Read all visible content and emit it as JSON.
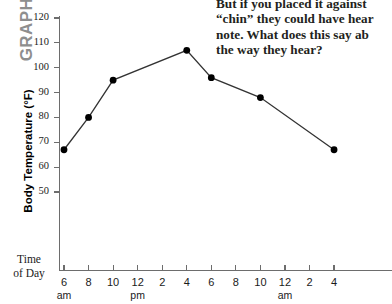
{
  "graph_label": "GRAPH A",
  "question": {
    "lines": [
      "But if you placed it against",
      "“chin” they could have hear",
      "note. What does this say ab",
      "the way they hear?"
    ]
  },
  "axes": {
    "y_title": "Body Temperature (°F)",
    "x_title_line1": "Time",
    "x_title_line2": "of Day"
  },
  "chart_data": {
    "type": "line",
    "title": "GRAPH A",
    "xlabel": "Time of Day",
    "ylabel": "Body Temperature (°F)",
    "ylim": [
      50,
      120
    ],
    "yticks": [
      50,
      60,
      70,
      80,
      90,
      100,
      110,
      120
    ],
    "ytick_labels": [
      "50",
      "60",
      "70",
      "80",
      "90",
      "100",
      "110",
      "120"
    ],
    "xtick_labels": [
      "6",
      "8",
      "10",
      "12",
      "2",
      "4",
      "6",
      "8",
      "10",
      "12",
      "2",
      "4"
    ],
    "xtick_sublabels": [
      "am",
      "",
      "",
      "pm",
      "",
      "",
      "",
      "",
      "",
      "am",
      "",
      ""
    ],
    "grid": false,
    "legend": false,
    "marker": "filled-circle",
    "series": [
      {
        "name": "Body Temperature",
        "x": [
          "6 am",
          "8 am",
          "10 am",
          "4 pm",
          "6 pm",
          "10 pm",
          "4 am"
        ],
        "values": [
          67,
          80,
          95,
          107,
          96,
          88,
          67
        ]
      }
    ]
  },
  "colors": {
    "line": "#333333",
    "marker": "#000000",
    "axis": "#6d6d6d",
    "graph_tag": "#8e8e8e",
    "text": "#231f20"
  }
}
